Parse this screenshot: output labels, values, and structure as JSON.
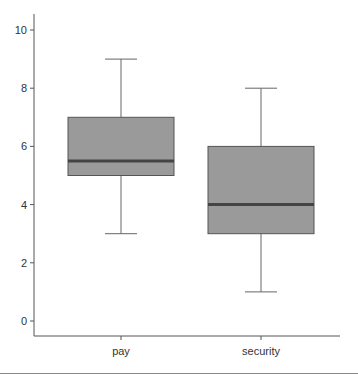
{
  "chart_data": {
    "type": "box",
    "title": "",
    "xlabel": "",
    "ylabel": "",
    "categories": [
      "pay",
      "security"
    ],
    "series": [
      {
        "name": "pay",
        "whisker_low": 3,
        "q1": 5,
        "median": 5.5,
        "q3": 7,
        "whisker_high": 9
      },
      {
        "name": "security",
        "whisker_low": 1,
        "q1": 3,
        "median": 4,
        "q3": 6,
        "whisker_high": 8
      }
    ],
    "yticks": [
      0,
      2,
      4,
      6,
      8,
      10
    ],
    "ylim": [
      -0.5,
      10.5
    ],
    "grid": false,
    "legend": null
  },
  "colors": {
    "box_fill": "#9a9a9a",
    "box_stroke": "#555555",
    "median": "#444444",
    "axis": "#555555"
  }
}
